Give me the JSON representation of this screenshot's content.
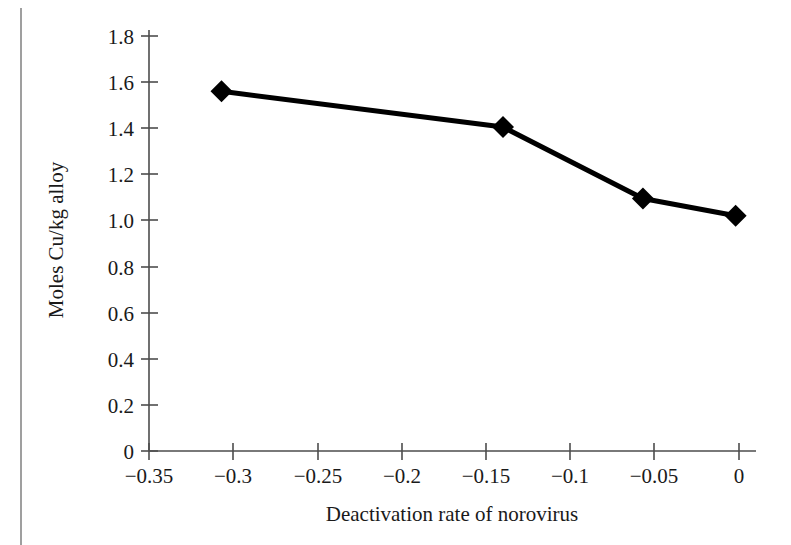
{
  "chart_data": {
    "type": "line",
    "title": "",
    "xlabel": "Deactivation rate of norovirus",
    "ylabel": "Moles Cu/kg alloy",
    "xlim": [
      -0.35,
      0.0
    ],
    "ylim": [
      0,
      1.8
    ],
    "grid": false,
    "legend": null,
    "marker": "filled-diamond",
    "line_color": "#000000",
    "marker_color": "#000000",
    "x": [
      -0.307,
      -0.14,
      -0.057,
      -0.002
    ],
    "y": [
      1.56,
      1.405,
      1.095,
      1.02
    ],
    "points": [
      {
        "x": -0.307,
        "y": 1.56
      },
      {
        "x": -0.14,
        "y": 1.405
      },
      {
        "x": -0.057,
        "y": 1.095
      },
      {
        "x": -0.002,
        "y": 1.02
      }
    ],
    "series": [
      {
        "name": "Moles Cu/kg alloy",
        "values": [
          1.56,
          1.405,
          1.095,
          1.02
        ]
      }
    ],
    "xticks": [
      -0.35,
      -0.3,
      -0.25,
      -0.2,
      -0.15,
      -0.1,
      -0.05,
      0
    ],
    "xtick_labels": [
      "−0.35",
      "−0.3",
      "−0.25",
      "−0.2",
      "−0.15",
      "−0.1",
      "−0.05",
      "0"
    ],
    "yticks": [
      0,
      0.2,
      0.4,
      0.6,
      0.8,
      1.0,
      1.2,
      1.4,
      1.6,
      1.8
    ],
    "ytick_labels": [
      "0",
      "0.2",
      "0.4",
      "0.6",
      "0.8",
      "1.0",
      "1.2",
      "1.4",
      "1.6",
      "1.8"
    ]
  },
  "figure": {
    "background_color": "#ffffff",
    "axis_color": "#4d4d4d",
    "page_rule_color": "#8e8e8e"
  }
}
